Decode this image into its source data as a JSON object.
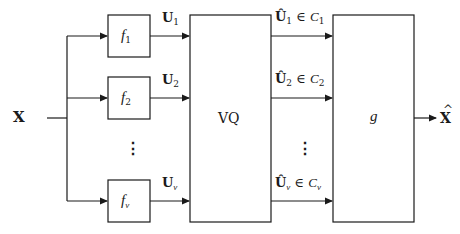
{
  "diagram": {
    "input": {
      "symbol": "X"
    },
    "output": {
      "symbol": "X",
      "accent": "^"
    },
    "encoders": [
      {
        "name": "f",
        "sub": "1",
        "signal": "U",
        "signal_sub": "1"
      },
      {
        "name": "f",
        "sub": "2",
        "signal": "U",
        "signal_sub": "2"
      },
      {
        "name": "f",
        "sub": "ν",
        "signal": "U",
        "signal_sub": "ν"
      }
    ],
    "quantizer": {
      "label": "VQ"
    },
    "quantized_outputs": [
      {
        "symbol": "Û",
        "sub": "1",
        "relation": "∈",
        "set": "C",
        "set_sub": "1"
      },
      {
        "symbol": "Û",
        "sub": "2",
        "relation": "∈",
        "set": "C",
        "set_sub": "2"
      },
      {
        "symbol": "Û",
        "sub": "ν",
        "relation": "∈",
        "set": "C",
        "set_sub": "ν"
      }
    ],
    "decoder": {
      "label": "g"
    },
    "ellipsis": "⋮",
    "colors": {
      "stroke": "#1a1a1a",
      "background": "#ffffff"
    }
  }
}
